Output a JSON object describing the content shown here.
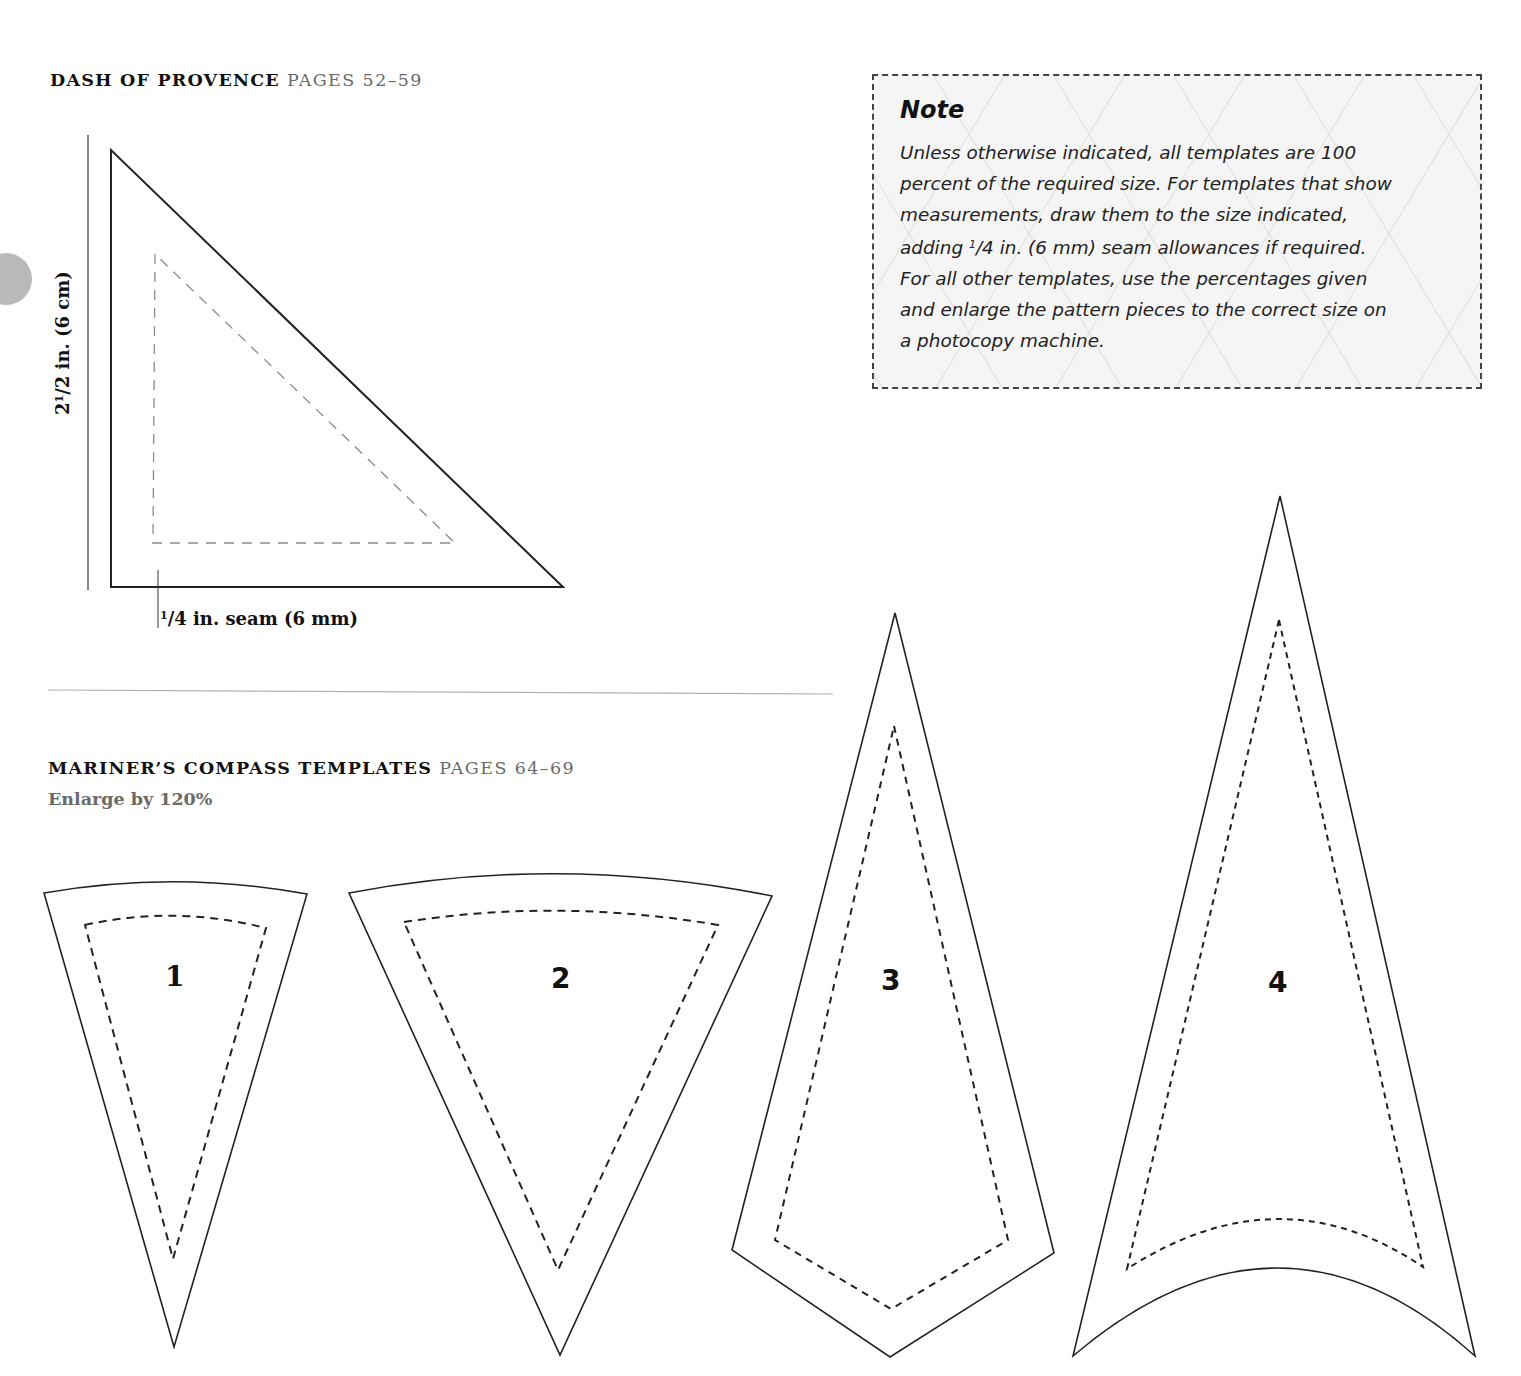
{
  "sections": {
    "dash_of_provence": {
      "title": "DASH OF PROVENCE",
      "pages": "PAGES 52–59",
      "height_label_whole": "2",
      "height_label_num": "1",
      "height_label_rest": "/2 in. (6 cm)",
      "seam_label_num": "1",
      "seam_label_rest": "/4 in. seam (6 mm)"
    },
    "mariners_compass": {
      "title": "MARINER’S COMPASS TEMPLATES",
      "pages": "PAGES 64–69",
      "subtitle": "Enlarge by 120%",
      "pieces": [
        {
          "label": "1"
        },
        {
          "label": "2"
        },
        {
          "label": "3"
        },
        {
          "label": "4"
        }
      ]
    }
  },
  "note": {
    "title": "Note",
    "line1": "Unless otherwise indicated, all templates are 100",
    "line2": "percent of the required size. For templates that show",
    "line3": "measurements, draw them to the size indicated,",
    "line4_pre": "adding ",
    "line4_frac_num": "1",
    "line4_post": "/4 in. (6 mm) seam allowances if required.",
    "line5": "For all other templates, use the percentages given",
    "line6": "and enlarge the pattern pieces to the correct size on",
    "line7": "a photocopy machine."
  },
  "colors": {
    "ink": "#111111",
    "page_ref_gray": "#6a6a6a",
    "note_bg": "#f5f5f5",
    "note_border": "#444444",
    "tab_marker": "#b9b9b9",
    "divider": "#b0b0b0",
    "triangle_seam": "#8a8a8a"
  }
}
